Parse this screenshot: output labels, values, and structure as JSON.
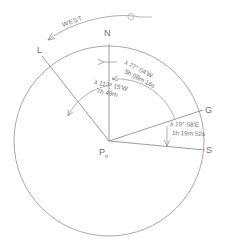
{
  "diagram": {
    "direction_label": "WEST",
    "points": {
      "center": {
        "label": "P",
        "subscript": "n"
      },
      "north": {
        "label": "N"
      },
      "local": {
        "label": "L"
      },
      "greenwich": {
        "label": "G"
      },
      "south_east": {
        "label": "S"
      }
    },
    "annotations": [
      {
        "id": "outer-arc",
        "longitude": "λ 77° 04'W",
        "time": "5h 08m 16s"
      },
      {
        "id": "inner-arc",
        "longitude": "λ 117° 15'W",
        "time": "7h 49m"
      },
      {
        "id": "east-arc",
        "longitude": "λ 19° 58'E",
        "time": "1h 19m 52s"
      }
    ],
    "colors": {
      "ink": "#8a8a8c",
      "ink_dark": "#6f6f70",
      "background": "#ffffff"
    }
  }
}
